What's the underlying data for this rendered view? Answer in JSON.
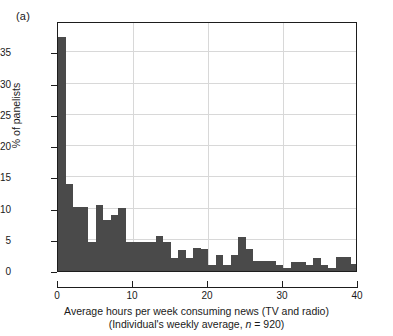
{
  "panel": {
    "letter": "(a)"
  },
  "axes": {
    "y_title": "% of panelists",
    "y_ticks": [
      "0",
      "5",
      "10",
      "15",
      "20",
      "25",
      "30",
      "35"
    ],
    "x_ticks": [
      "0",
      "10",
      "20",
      "30",
      "40"
    ],
    "x_caption_line1": "Average hours per week consuming news (TV and radio)",
    "x_caption_line2_pre": "(Individual's weekly average, ",
    "x_caption_line2_ital": "n",
    "x_caption_line2_post": " = 920)"
  },
  "style": {
    "bar_color": "#4a4a4a",
    "frame_color": "#1d1d1d",
    "grid_color": "#d8d8d8",
    "background": "#ffffff"
  },
  "chart_data": {
    "type": "bar",
    "title": "",
    "subtitle": "",
    "xlabel": "Average hours per week consuming news (TV and radio) (Individual's weekly average, n = 920)",
    "ylabel": "% of panelists",
    "xlim": [
      0,
      40
    ],
    "ylim": [
      0,
      40
    ],
    "xticks": [
      0,
      10,
      20,
      30,
      40
    ],
    "yticks": [
      0,
      5,
      10,
      15,
      20,
      25,
      30,
      35
    ],
    "grid": true,
    "legend": null,
    "sample_size": 920,
    "bin_width": 1,
    "bin_unit": "hours per week",
    "bin_starts": [
      0,
      1,
      2,
      3,
      4,
      5,
      6,
      7,
      8,
      9,
      10,
      11,
      12,
      13,
      14,
      15,
      16,
      17,
      18,
      19,
      20,
      21,
      22,
      23,
      24,
      25,
      26,
      27,
      28,
      29,
      30,
      31,
      32,
      33,
      34,
      35,
      36,
      37,
      38,
      39
    ],
    "categories": [
      "0-1",
      "1-2",
      "2-3",
      "3-4",
      "4-5",
      "5-6",
      "6-7",
      "7-8",
      "8-9",
      "9-10",
      "10-11",
      "11-12",
      "12-13",
      "13-14",
      "14-15",
      "15-16",
      "16-17",
      "17-18",
      "18-19",
      "19-20",
      "20-21",
      "21-22",
      "22-23",
      "23-24",
      "24-25",
      "25-26",
      "26-27",
      "27-28",
      "28-29",
      "29-30",
      "30-31",
      "31-32",
      "32-33",
      "33-34",
      "34-35",
      "35-36",
      "36-37",
      "37-38",
      "38-39",
      "39-40"
    ],
    "values": [
      37.5,
      14.0,
      10.2,
      10.2,
      4.7,
      10.5,
      8.1,
      8.9,
      10.1,
      4.7,
      4.7,
      4.7,
      4.7,
      5.6,
      4.7,
      2.1,
      3.3,
      2.1,
      3.7,
      3.6,
      1.0,
      2.6,
      1.0,
      2.6,
      5.4,
      3.5,
      1.6,
      1.6,
      1.6,
      1.0,
      0.5,
      1.5,
      1.5,
      1.0,
      2.1,
      1.0,
      0.5,
      2.3,
      2.3,
      1.1
    ]
  }
}
